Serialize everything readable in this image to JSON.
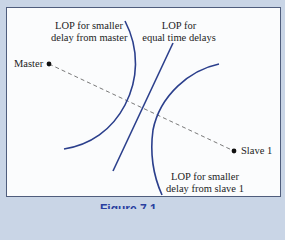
{
  "diagram": {
    "nodes": [
      {
        "id": "master",
        "label": "Master",
        "x": 49,
        "y": 64
      },
      {
        "id": "slave1",
        "label": "Slave 1",
        "x": 234,
        "y": 151
      }
    ],
    "baseline": {
      "from": "master",
      "to": "slave1",
      "style": "dashed"
    },
    "curves": [
      {
        "id": "lop-master",
        "label_line1": "LOP for smaller",
        "label_line2": "delay from master",
        "shape": "arc"
      },
      {
        "id": "lop-equal",
        "label_line1": "LOP for",
        "label_line2": "equal time delays",
        "shape": "line"
      },
      {
        "id": "lop-slave1",
        "label_line1": "LOP for smaller",
        "label_line2": "delay from slave 1",
        "shape": "arc"
      }
    ],
    "colors": {
      "curve": "#2b3f8c",
      "baseline": "#6a6a6a",
      "node": "#111111",
      "background": "#c9d5e6",
      "frame": "#fbfcfd",
      "frame_border": "#4f5d7c"
    },
    "caption": "Figure 7.1"
  }
}
